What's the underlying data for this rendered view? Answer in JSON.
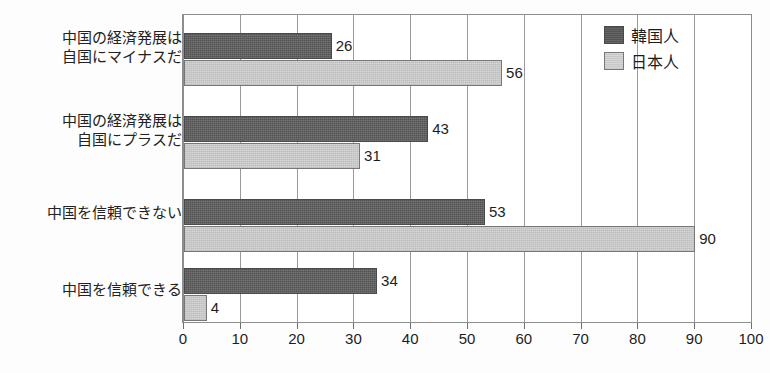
{
  "chart_data": {
    "type": "bar",
    "orientation": "horizontal",
    "title": "",
    "subtitle": "",
    "xlabel": "",
    "ylabel": "",
    "xlim": [
      0,
      100
    ],
    "xticks": [
      0,
      10,
      20,
      30,
      40,
      50,
      60,
      70,
      80,
      90,
      100
    ],
    "xtick_labels": [
      "0",
      "10",
      "20",
      "30",
      "40",
      "50",
      "60",
      "70",
      "80",
      "90",
      "100"
    ],
    "grid": true,
    "grid_axis": "x",
    "legend_position": "top-right",
    "categories": [
      "中国の経済発展は\n自国にマイナスだ",
      "中国の経済発展は\n自国にプラスだ",
      "中国を信頼できない",
      "中国を信頼できる"
    ],
    "series": [
      {
        "name": "韓国人",
        "color": "#545454",
        "values": [
          26,
          43,
          53,
          34
        ],
        "value_labels": [
          "26",
          "43",
          "53",
          "34"
        ]
      },
      {
        "name": "日本人",
        "color": "#d6d6d6",
        "values": [
          56,
          31,
          90,
          4
        ],
        "value_labels": [
          "56",
          "31",
          "90",
          "4"
        ]
      }
    ]
  },
  "legend": {
    "items": [
      {
        "label": "韓国人",
        "swatch": "dark-gray-swatch"
      },
      {
        "label": "日本人",
        "swatch": "light-gray-swatch"
      }
    ]
  }
}
